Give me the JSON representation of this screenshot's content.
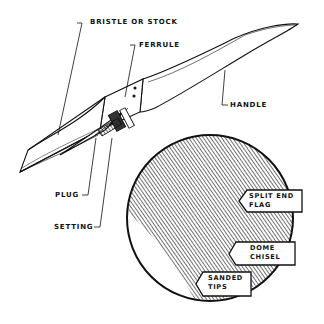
{
  "diagram": {
    "labels": {
      "bristle": "BRISTLE OR STOCK",
      "ferrule": "FERRULE",
      "handle": "HANDLE",
      "plug": "PLUG",
      "setting": "SETTING"
    },
    "tip_tags": [
      {
        "line1": "SPLIT END",
        "line2": "FLAG"
      },
      {
        "line1": "DOME",
        "line2": "CHISEL"
      },
      {
        "line1": "SANDED",
        "line2": "TIPS"
      }
    ],
    "colors": {
      "ink": "#111111",
      "background": "#ffffff"
    }
  }
}
